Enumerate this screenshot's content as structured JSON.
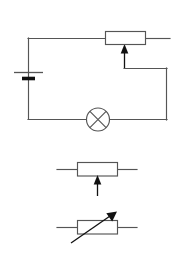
{
  "diagram": {
    "stroke_color": "#555555",
    "accent_color": "#111111",
    "background_color": "#ffffff",
    "circuit": {
      "name": "potentiometer-lamp-circuit",
      "components": [
        {
          "id": "battery",
          "type": "battery-cell",
          "label": "",
          "position": {
            "x": 28,
            "y": 76
          }
        },
        {
          "id": "potentiometer",
          "type": "potentiometer",
          "label": "",
          "position": {
            "x": 125,
            "y": 40
          }
        },
        {
          "id": "lamp",
          "type": "lamp",
          "label": "",
          "position": {
            "x": 98,
            "y": 119
          }
        }
      ],
      "wires": [
        {
          "id": "top-wire-left",
          "from": "battery-top",
          "to": "potentiometer-left"
        },
        {
          "id": "top-wire-right",
          "from": "potentiometer-right",
          "to": "open-terminal"
        },
        {
          "id": "wiper-wire",
          "from": "potentiometer-wiper",
          "to": "right-rail"
        },
        {
          "id": "bottom-wire",
          "from": "right-rail",
          "to": "battery-bottom"
        }
      ]
    },
    "legend": {
      "name": "component-symbol-legend",
      "symbols": [
        {
          "id": "potentiometer-symbol",
          "type": "potentiometer",
          "label": "",
          "description": "resistor box with vertical wiper arrow pointing up"
        },
        {
          "id": "variable-resistor-symbol",
          "type": "variable-resistor",
          "label": "",
          "description": "resistor box with diagonal arrow through it"
        }
      ]
    }
  }
}
